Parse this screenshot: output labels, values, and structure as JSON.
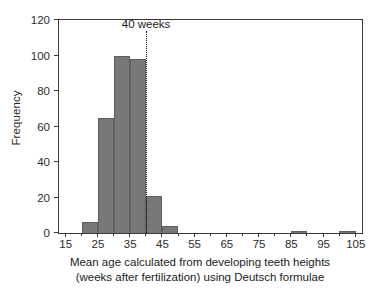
{
  "chart_data": {
    "type": "bar",
    "subtype": "histogram",
    "title": "",
    "xlabel_line1": "Mean age calculated from developing teeth heights",
    "xlabel_line2": "(weeks after fertilization) using Deutsch formulae",
    "ylabel": "Frequency",
    "xlim": [
      13,
      107
    ],
    "ylim": [
      0,
      120
    ],
    "bin_width": 5,
    "grid": false,
    "legend": null,
    "x_major_ticks": [
      15,
      25,
      35,
      45,
      55,
      65,
      75,
      85,
      95,
      105
    ],
    "x_minor_ticks": [
      20,
      30,
      40,
      50,
      60,
      70,
      80,
      90,
      100
    ],
    "x_tick_labels": [
      "15",
      "25",
      "35",
      "45",
      "55",
      "65",
      "75",
      "85",
      "95",
      "105"
    ],
    "y_ticks": [
      0,
      20,
      40,
      60,
      80,
      100,
      120
    ],
    "y_tick_labels": [
      "0",
      "20",
      "40",
      "60",
      "80",
      "100",
      "120"
    ],
    "bars": [
      {
        "bin_start": 20,
        "bin_end": 25,
        "value": 6
      },
      {
        "bin_start": 25,
        "bin_end": 30,
        "value": 65
      },
      {
        "bin_start": 30,
        "bin_end": 35,
        "value": 100
      },
      {
        "bin_start": 35,
        "bin_end": 40,
        "value": 98
      },
      {
        "bin_start": 40,
        "bin_end": 45,
        "value": 21
      },
      {
        "bin_start": 45,
        "bin_end": 50,
        "value": 4
      },
      {
        "bin_start": 85,
        "bin_end": 90,
        "value": 1
      },
      {
        "bin_start": 100,
        "bin_end": 105,
        "value": 1
      }
    ],
    "categories": [
      "20-25",
      "25-30",
      "30-35",
      "35-40",
      "40-45",
      "45-50",
      "85-90",
      "100-105"
    ],
    "values": [
      6,
      65,
      100,
      98,
      21,
      4,
      1,
      1
    ],
    "annotations": [
      {
        "type": "vline",
        "x": 40,
        "label": "40 weeks",
        "style": "dotted"
      }
    ],
    "colors": {
      "bar_fill": "#787878",
      "bar_edge": "#5e5e5e",
      "axis": "#3a3a3a",
      "text": "#1a1a1a",
      "annotation_line": "#141414",
      "background": "#ffffff"
    }
  }
}
